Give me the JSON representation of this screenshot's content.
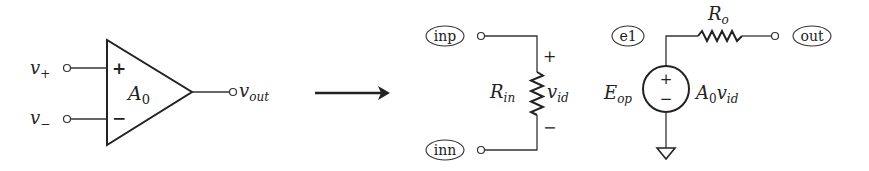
{
  "opamp": {
    "input_plus_label": "v",
    "input_plus_sub": "+",
    "input_minus_label": "v",
    "input_minus_sub": "−",
    "plus_sign": "+",
    "minus_sign": "−",
    "gain_label": "A",
    "gain_sub": "0",
    "output_label": "v",
    "output_sub": "out"
  },
  "arrow": {
    "direction": "right"
  },
  "model": {
    "nodes": {
      "inp": "inp",
      "inn": "inn",
      "e1": "e1",
      "out": "out"
    },
    "input_resistor": {
      "label": "R",
      "sub": "in"
    },
    "vid": {
      "label": "v",
      "sub": "id",
      "plus": "+",
      "minus": "−"
    },
    "source": {
      "name": "E",
      "name_sub": "op",
      "plus": "+",
      "minus": "−",
      "value_A": "A",
      "value_A_sub": "0",
      "value_v": "v",
      "value_v_sub": "id"
    },
    "output_resistor": {
      "label": "R",
      "sub": "o"
    }
  }
}
